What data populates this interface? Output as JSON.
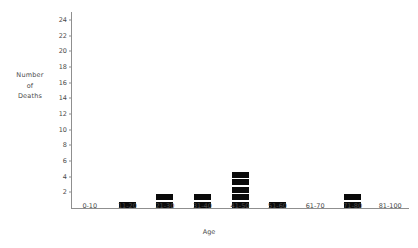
{
  "chart_data": {
    "type": "bar",
    "title": "",
    "subtitle": "",
    "xlabel": "Age",
    "ylabel": "Number of Deaths",
    "ylabel_lines": [
      "Number",
      "of",
      "Deaths"
    ],
    "categories": [
      "0-10",
      "11-20",
      "21-30",
      "31-40",
      "41-50",
      "51-60",
      "61-70",
      "71-80",
      "81-100"
    ],
    "values": [
      0,
      1,
      2,
      2,
      5,
      1,
      0,
      2,
      0
    ],
    "ylim": [
      0,
      25
    ],
    "yticks": [
      2,
      4,
      6,
      8,
      10,
      12,
      14,
      16,
      18,
      20,
      22,
      24
    ],
    "ytick_labels": [
      "2",
      "4",
      "6",
      "8",
      "10",
      "12",
      "14",
      "16",
      "18",
      "20",
      "22",
      "24"
    ],
    "grid": false,
    "legend": null,
    "bar_style": "stacked-unit-blocks",
    "bar_color": "#0a0a0a",
    "axis_color": "#8f8f8f",
    "text_color": "#4a4a4a",
    "background": "#ffffff",
    "annotations": []
  }
}
